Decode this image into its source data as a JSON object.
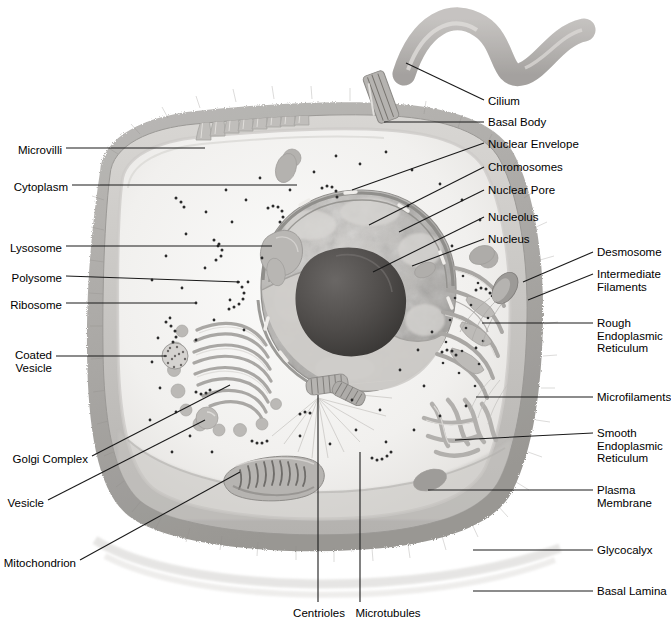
{
  "figure": {
    "colors": {
      "background": "#ffffff",
      "leader_line": "#1a1a1a",
      "label_text": "#000000",
      "cytoplasm": "#f2f1ef",
      "glycocalyx": "#a9a7a4",
      "plasma_membrane": "#c9c7c4",
      "nucleoplasm": "#b9b7b4",
      "nucleolus": "#4d4b49",
      "organelle_gray": "#b0aeab",
      "ribosome_dot": "#2b2b2b"
    }
  },
  "labels_left": [
    {
      "id": "microvilli",
      "text": "Microvilli",
      "x": 6,
      "y": 144
    },
    {
      "id": "cytoplasm",
      "text": "Cytoplasm",
      "x": 6,
      "y": 181
    },
    {
      "id": "lysosome",
      "text": "Lysosome",
      "x": 6,
      "y": 242
    },
    {
      "id": "polysome",
      "text": "Polysome",
      "x": 6,
      "y": 272
    },
    {
      "id": "ribosome",
      "text": "Ribosome",
      "x": 6,
      "y": 299
    },
    {
      "id": "coated-vesicle",
      "text": "Coated\nVesicle",
      "x": 6,
      "y": 352
    },
    {
      "id": "golgi-complex",
      "text": "Golgi Complex",
      "x": 6,
      "y": 459
    },
    {
      "id": "vesicle",
      "text": "Vesicle",
      "x": 6,
      "y": 503
    },
    {
      "id": "mitochondrion",
      "text": "Mitochondrion",
      "x": 6,
      "y": 563
    }
  ],
  "labels_right_inner": [
    {
      "id": "cilium",
      "text": "Cilium",
      "x": 488,
      "y": 97
    },
    {
      "id": "basal-body",
      "text": "Basal Body",
      "x": 488,
      "y": 119
    },
    {
      "id": "nuclear-envelope",
      "text": "Nuclear Envelope",
      "x": 488,
      "y": 140
    },
    {
      "id": "chromosomes",
      "text": "Chromosomes",
      "x": 488,
      "y": 164
    },
    {
      "id": "nuclear-pore",
      "text": "Nuclear Pore",
      "x": 488,
      "y": 187
    },
    {
      "id": "nucleolus",
      "text": "Nucleolus",
      "x": 488,
      "y": 214
    },
    {
      "id": "nucleus",
      "text": "Nucleus",
      "x": 488,
      "y": 236
    }
  ],
  "labels_right_outer": [
    {
      "id": "desmosome",
      "text": "Desmosome",
      "x": 597,
      "y": 249
    },
    {
      "id": "intermediate-filaments",
      "text": "Intermediate\nFilaments",
      "x": 597,
      "y": 271
    },
    {
      "id": "rough-er",
      "text": "Rough\nEndoplasmic\nReticulum",
      "x": 597,
      "y": 320
    },
    {
      "id": "microfilaments",
      "text": "Microfilaments",
      "x": 597,
      "y": 394
    },
    {
      "id": "smooth-er",
      "text": "Smooth\nEndoplasmic\nReticulum",
      "x": 597,
      "y": 430
    },
    {
      "id": "plasma-membrane",
      "text": "Plasma\nMembrane",
      "x": 597,
      "y": 487
    },
    {
      "id": "glycocalyx",
      "text": "Glycocalyx",
      "x": 597,
      "y": 547
    },
    {
      "id": "basal-lamina",
      "text": "Basal Lamina",
      "x": 597,
      "y": 588
    }
  ],
  "labels_bottom": [
    {
      "id": "centrioles",
      "text": "Centrioles",
      "x": 287,
      "y": 612
    },
    {
      "id": "microtubules",
      "text": "Microtubules",
      "x": 349,
      "y": 612
    }
  ],
  "leader_lines": [
    {
      "id": "leader-microvilli",
      "points": "66,148 205,148"
    },
    {
      "id": "leader-cytoplasm",
      "points": "70,185 297,185"
    },
    {
      "id": "leader-lysosome",
      "points": "66,246 272,246"
    },
    {
      "id": "leader-polysome",
      "points": "66,276 240,282"
    },
    {
      "id": "leader-ribosome",
      "points": "66,303 195,303"
    },
    {
      "id": "leader-coated-vesicle",
      "points": "56,356 167,356"
    },
    {
      "id": "leader-golgi",
      "points": "92,456 230,385"
    },
    {
      "id": "leader-vesicle",
      "points": "48,500 205,420"
    },
    {
      "id": "leader-mitochondrion",
      "points": "80,560 240,472"
    },
    {
      "id": "leader-cilium",
      "points": "484,100 406,63"
    },
    {
      "id": "leader-basal-body",
      "points": "484,122 384,122"
    },
    {
      "id": "leader-nuclear-envelope",
      "points": "484,143 352,190"
    },
    {
      "id": "leader-chromosomes",
      "points": "484,167 369,225"
    },
    {
      "id": "leader-nuclear-pore",
      "points": "484,190 397,234"
    },
    {
      "id": "leader-nucleolus",
      "points": "484,217 373,272"
    },
    {
      "id": "leader-nucleus",
      "points": "484,239 410,268"
    },
    {
      "id": "leader-desmosome",
      "points": "593,252 529,283"
    },
    {
      "id": "leader-intermediate",
      "points": "593,274 531,300"
    },
    {
      "id": "leader-rough-er",
      "points": "593,323 482,323"
    },
    {
      "id": "leader-microfilaments",
      "points": "593,397 476,397"
    },
    {
      "id": "leader-smooth-er",
      "points": "593,433 455,440"
    },
    {
      "id": "leader-plasma-membrane",
      "points": "593,490 428,490"
    },
    {
      "id": "leader-glycocalyx",
      "points": "593,550 473,550"
    },
    {
      "id": "leader-basal-lamina",
      "points": "593,591 473,591"
    },
    {
      "id": "leader-centrioles",
      "points": "318,602 318,395"
    },
    {
      "id": "leader-microtubules",
      "points": "360,602 360,452"
    }
  ],
  "structures": [
    {
      "id": "cilium",
      "name": "Cilium",
      "kind": "wavy-tube"
    },
    {
      "id": "basal-body",
      "name": "Basal Body",
      "kind": "striated-cylinder"
    },
    {
      "id": "microvilli",
      "name": "Microvilli",
      "kind": "finger-projections",
      "count": 13
    },
    {
      "id": "glycocalyx",
      "name": "Glycocalyx",
      "kind": "fuzzy-coat"
    },
    {
      "id": "plasma-membrane",
      "name": "Plasma Membrane",
      "kind": "outline"
    },
    {
      "id": "cytoplasm",
      "name": "Cytoplasm",
      "kind": "fill"
    },
    {
      "id": "nucleus",
      "name": "Nucleus",
      "kind": "cut-sphere"
    },
    {
      "id": "nucleolus",
      "name": "Nucleolus",
      "kind": "dark-blob"
    },
    {
      "id": "chromosomes",
      "name": "Chromosomes",
      "kind": "mottled-texture"
    },
    {
      "id": "nuclear-envelope",
      "name": "Nuclear Envelope",
      "kind": "double-membrane"
    },
    {
      "id": "nuclear-pore",
      "name": "Nuclear Pore",
      "kind": "gap"
    },
    {
      "id": "golgi-complex",
      "name": "Golgi Complex",
      "kind": "stacked-cisternae",
      "count": 9
    },
    {
      "id": "rough-er",
      "name": "Rough Endoplasmic Reticulum",
      "kind": "flattened-cisternae"
    },
    {
      "id": "smooth-er",
      "name": "Smooth Endoplasmic Reticulum",
      "kind": "tubular-network"
    },
    {
      "id": "mitochondrion",
      "name": "Mitochondrion",
      "kind": "cristae-oval"
    },
    {
      "id": "centrioles",
      "name": "Centrioles",
      "kind": "paired-cylinders",
      "count": 2
    },
    {
      "id": "microtubules",
      "name": "Microtubules",
      "kind": "radiating-lines"
    },
    {
      "id": "lysosome",
      "name": "Lysosome",
      "kind": "blob"
    },
    {
      "id": "vesicle",
      "name": "Vesicle",
      "kind": "sphere"
    },
    {
      "id": "coated-vesicle",
      "name": "Coated Vesicle",
      "kind": "stippled-circle"
    },
    {
      "id": "ribosome",
      "name": "Ribosome",
      "kind": "dots"
    },
    {
      "id": "polysome",
      "name": "Polysome",
      "kind": "dot-chains"
    },
    {
      "id": "desmosome",
      "name": "Desmosome",
      "kind": "junction-plaque"
    },
    {
      "id": "intermediate-filaments",
      "name": "Intermediate Filaments",
      "kind": "fine-fibers"
    },
    {
      "id": "microfilaments",
      "name": "Microfilaments",
      "kind": "fine-fibers"
    },
    {
      "id": "basal-lamina",
      "name": "Basal Lamina",
      "kind": "basal-sheet"
    }
  ]
}
